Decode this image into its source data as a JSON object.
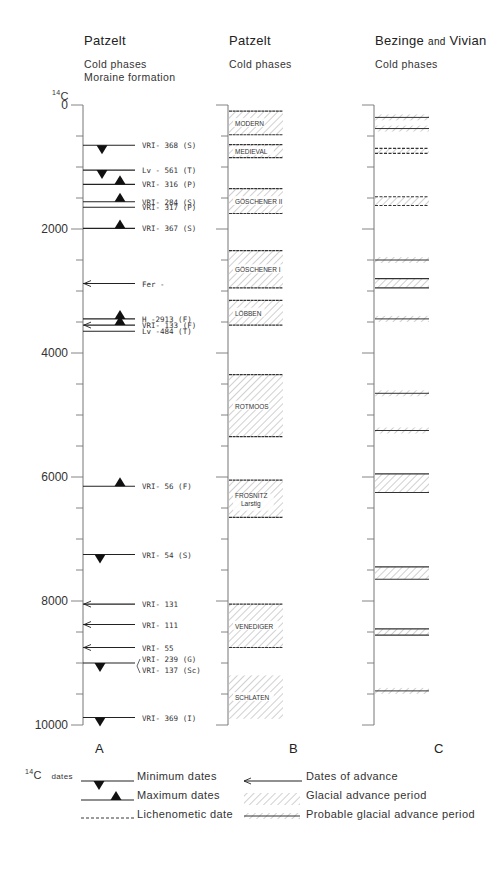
{
  "columns": {
    "A": {
      "author": "Patzelt",
      "subtitle_lines": [
        "Cold phases",
        "Moraine formation"
      ],
      "letter": "A"
    },
    "B": {
      "author": "Patzelt",
      "subtitle_lines": [
        "Cold phases"
      ],
      "letter": "B"
    },
    "C": {
      "author_main": "Bezinge",
      "author_join": "and",
      "author_second": "Vivian",
      "subtitle_lines": [
        "Cold phases"
      ],
      "letter": "C"
    }
  },
  "axis": {
    "label_sup": "14",
    "label": "C",
    "min": 0,
    "max": 10000,
    "major_ticks": [
      0,
      2000,
      4000,
      6000,
      8000,
      10000
    ],
    "minor_step": 500
  },
  "chart_data": {
    "type": "table",
    "column_A_dates": [
      {
        "label": "VRI- 368",
        "code": "S",
        "age": 650,
        "marker": "min"
      },
      {
        "label": "Lv - 561",
        "code": "T",
        "age": 1050,
        "marker": "min"
      },
      {
        "label": "VRI- 316",
        "code": "P",
        "age": 1280,
        "marker": "max"
      },
      {
        "label": "VRI- 284",
        "code": "S",
        "age": 1560,
        "marker": "max"
      },
      {
        "label": "VRI- 317",
        "code": "P",
        "age": 1650,
        "marker": "none"
      },
      {
        "label": "VRI- 367",
        "code": "S",
        "age": 1990,
        "marker": "max"
      },
      {
        "label": "Fer -",
        "code": "",
        "age": 2880,
        "marker": "arrow"
      },
      {
        "label": "H -2913",
        "code": "F",
        "age": 3450,
        "marker": "max"
      },
      {
        "label": "VRI- 133",
        "code": "F",
        "age": 3550,
        "marker": "max-arrow"
      },
      {
        "label": "Lv -484",
        "code": "T",
        "age": 3650,
        "marker": "none"
      },
      {
        "label": "VRI- 56",
        "code": "F",
        "age": 6150,
        "marker": "max"
      },
      {
        "label": "VRI- 54",
        "code": "S",
        "age": 7250,
        "marker": "min"
      },
      {
        "label": "VRI- 131",
        "code": "",
        "age": 8050,
        "marker": "arrow"
      },
      {
        "label": "VRI- 111",
        "code": "",
        "age": 8380,
        "marker": "arrow"
      },
      {
        "label": "VRI- 55",
        "code": "",
        "age": 8750,
        "marker": "arrow"
      },
      {
        "label": "VRI- 239",
        "code": "G",
        "age": 9000,
        "marker": "min",
        "bracket": true
      },
      {
        "label": "VRI- 137",
        "code": "Sc",
        "age": 9000,
        "marker": "none",
        "bracket_second": true
      },
      {
        "label": "VRI- 369",
        "code": "I",
        "age": 9880,
        "marker": "min"
      }
    ],
    "column_B_periods": [
      {
        "name": "MODERN",
        "start": 100,
        "end": 480
      },
      {
        "name": "MEDIEVAL",
        "start": 640,
        "end": 850
      },
      {
        "name": "GÖSCHENER II",
        "start": 1350,
        "end": 1750
      },
      {
        "name": "GÖSCHENER I",
        "start": 2350,
        "end": 2950
      },
      {
        "name": "LÖBBEN",
        "start": 3150,
        "end": 3550
      },
      {
        "name": "ROTMOOS",
        "start": 4350,
        "end": 5350
      },
      {
        "name": "FROSNITZ",
        "name2": "Larstig",
        "start": 6050,
        "end": 6650
      },
      {
        "name": "VENEDIGER",
        "start": 8050,
        "end": 8750
      },
      {
        "name": "SCHLATEN",
        "start": 9200,
        "end": 9900,
        "no_lines": true
      }
    ],
    "column_C_periods": [
      {
        "start": 200,
        "end": 200,
        "type": "probable"
      },
      {
        "start": 380,
        "end": 450,
        "type": "probable"
      },
      {
        "start": 700,
        "end": 780,
        "type": "glacial-dashed"
      },
      {
        "start": 1480,
        "end": 1620,
        "type": "glacial-dashed"
      },
      {
        "start": 2500,
        "end": 2500,
        "type": "probable"
      },
      {
        "start": 2800,
        "end": 2950,
        "type": "glacial"
      },
      {
        "start": 3450,
        "end": 3450,
        "type": "probable"
      },
      {
        "start": 4650,
        "end": 4650,
        "type": "probable"
      },
      {
        "start": 5250,
        "end": 5250,
        "type": "probable"
      },
      {
        "start": 5950,
        "end": 6250,
        "type": "glacial"
      },
      {
        "start": 7450,
        "end": 7650,
        "type": "glacial"
      },
      {
        "start": 8450,
        "end": 8550,
        "type": "glacial"
      },
      {
        "start": 9450,
        "end": 9450,
        "type": "probable"
      }
    ]
  },
  "legend": {
    "prefix_sup": "14",
    "prefix": "C",
    "prefix_small": "dates",
    "items_left": [
      {
        "key": "min",
        "label": "Minimum dates"
      },
      {
        "key": "max",
        "label": "Maximum dates"
      },
      {
        "key": "lichen",
        "label": "Lichenometic date"
      }
    ],
    "items_right": [
      {
        "key": "arrow",
        "label": "Dates of advance"
      },
      {
        "key": "glacial",
        "label": "Glacial advance period"
      },
      {
        "key": "probable",
        "label": "Probable glacial advance period"
      }
    ]
  },
  "colors": {
    "ink": "#222222",
    "axis": "#777777",
    "hatch": "#8a8a8a"
  }
}
